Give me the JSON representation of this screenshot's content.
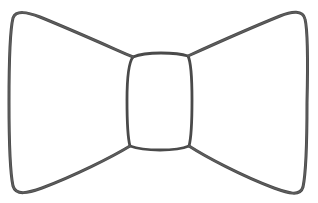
{
  "canvas": {
    "width": 318,
    "height": 203,
    "background_color": "#ffffff",
    "title": "Bow tie line drawing"
  },
  "drawing": {
    "subject": "bow-tie",
    "style": "hand-drawn single-line outline sketch",
    "ink_color": "#4a4a4a",
    "ink_color_soft": "#6b6b6b",
    "stroke_width": 3,
    "stroke_width_knot": 2.8,
    "fill": "none",
    "parts": [
      {
        "name": "left-wing",
        "label": "Left bow wing",
        "path": "M 133 57 C 110 47 72 30 40 17 C 27 12 16 10 13 18 C 10 30 9 60 9 102 C 9 140 10 172 13 186 C 16 196 28 193 42 188 C 74 176 112 157 130 146"
      },
      {
        "name": "right-wing",
        "label": "Right bow wing",
        "path": "M 188 56 C 210 46 248 29 280 16 C 292 11 303 10 305 19 C 308 31 308 61 307 103 C 307 141 306 173 303 187 C 300 197 288 193 274 188 C 242 176 206 157 189 146"
      },
      {
        "name": "center-knot",
        "label": "Center knot",
        "path": "M 133 57 C 140 54 150 53 161 53 C 172 53 182 54 188 56 C 191 62 192 78 192 100 C 192 123 191 139 189 146 C 182 149 172 150 160 150 C 148 150 138 149 130 146 C 128 139 127 122 127 100 C 127 78 129 62 133 57 Z"
      }
    ]
  },
  "ui": {
    "alt_text": "A simple hand-drawn black outline sketch of a bow tie on a white background"
  }
}
